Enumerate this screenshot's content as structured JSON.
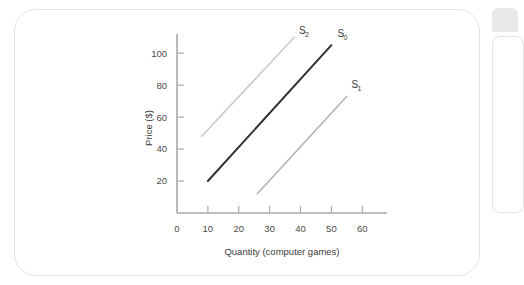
{
  "chart_data": {
    "type": "line",
    "title": "",
    "xlabel": "Quantity (computer games)",
    "ylabel": "Price ($)",
    "xlim": [
      0,
      68
    ],
    "ylim": [
      0,
      112
    ],
    "grid": false,
    "legend_position": "inline-end-labels",
    "x_ticks": [
      "0",
      "10",
      "20",
      "30",
      "40",
      "50",
      "60"
    ],
    "x_tick_values": [
      0,
      10,
      20,
      30,
      40,
      50,
      60
    ],
    "y_ticks": [
      "20",
      "40",
      "60",
      "80",
      "100"
    ],
    "y_tick_values": [
      20,
      40,
      60,
      80,
      100
    ],
    "series": [
      {
        "name": "S₂",
        "label_base": "S",
        "label_sub": "2",
        "color": "#c9c9c9",
        "width": 1.6,
        "points": [
          [
            8,
            48
          ],
          [
            38,
            110
          ]
        ],
        "label_at": [
          39.5,
          112
        ]
      },
      {
        "name": "S₀",
        "label_base": "S",
        "label_sub": "0",
        "color": "#2f2f2f",
        "width": 2.0,
        "points": [
          [
            10,
            20
          ],
          [
            50,
            105
          ]
        ],
        "label_at": [
          52,
          110
        ]
      },
      {
        "name": "S₁",
        "label_base": "S",
        "label_sub": "1",
        "color": "#b4b4b4",
        "width": 1.6,
        "points": [
          [
            26,
            12
          ],
          [
            55,
            73
          ]
        ],
        "label_at": [
          56.5,
          78
        ]
      }
    ]
  },
  "figure": {
    "card_label": "supply-curves-figure"
  },
  "side_panels": {
    "tab_label": "",
    "card_label": ""
  }
}
